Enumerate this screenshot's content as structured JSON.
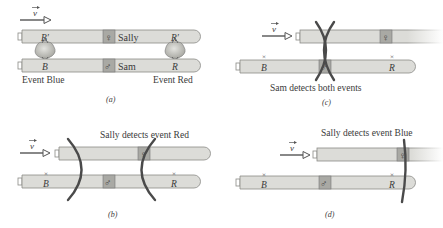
{
  "colors": {
    "rod_fill": "#dcdcd8",
    "rod_stroke": "#8a8a86",
    "box_fill": "#a9a9a4",
    "arc": "#4a4a4a",
    "text": "#3a3a3a",
    "explosion": "#b8b8b2"
  },
  "panels": [
    {
      "id": "a",
      "caption": "(a)",
      "velocity_label": "v",
      "sally_rod": {
        "name": "Sally",
        "symbol": "♀",
        "marks": [
          "B′",
          "R′"
        ]
      },
      "sam_rod": {
        "name": "Sam",
        "symbol": "♂",
        "marks": [
          "B",
          "R"
        ]
      },
      "event_labels": [
        "Event Blue",
        "Event Red"
      ]
    },
    {
      "id": "b",
      "caption": "(b)",
      "velocity_label": "v",
      "heading": "Sally detects event Red",
      "sally_rod": {
        "symbol": "♀"
      },
      "sam_rod": {
        "symbol": "♂",
        "marks": [
          "B",
          "R"
        ]
      }
    },
    {
      "id": "c",
      "caption": "(c)",
      "velocity_label": "v",
      "heading": "Sam detects both events",
      "sally_rod": {
        "symbol": "♀"
      },
      "sam_rod": {
        "symbol": "♂",
        "marks": [
          "B",
          "R"
        ]
      }
    },
    {
      "id": "d",
      "caption": "(d)",
      "velocity_label": "v",
      "heading": "Sally detects event Blue",
      "sally_rod": {
        "symbol": "♀"
      },
      "sam_rod": {
        "symbol": "♂",
        "marks": [
          "B",
          "R"
        ]
      }
    }
  ]
}
